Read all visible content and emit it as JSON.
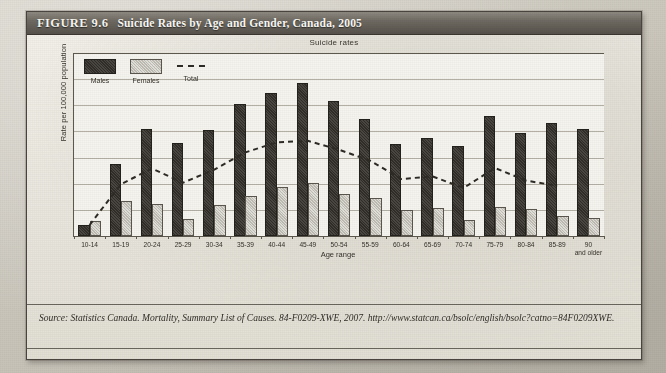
{
  "figure": {
    "label": "FIGURE 9.6",
    "title": "Suicide Rates by Age and Gender, Canada, 2005",
    "source": "Source: Statistics Canada. Mortality, Summary List of Causes. 84-F0209-XWE, 2007. http://www.statcan.ca/bsolc/english/bsolc?catno=84F0209XWE."
  },
  "legend": {
    "males": "Males",
    "females": "Females",
    "total": "Total"
  },
  "chart_data": {
    "type": "bar",
    "title": "Suicide rates",
    "xlabel": "Age range",
    "ylabel": "Rate per 100,000 population",
    "ylim": [
      0,
      35
    ],
    "yticks": [
      "0.0",
      "5.0",
      "10.0",
      "15.0",
      "20.0",
      "25.0",
      "30.0",
      "35.0"
    ],
    "grid": true,
    "legend_position": "top-left",
    "categories": [
      "10-14",
      "15-19",
      "20-24",
      "25-29",
      "30-34",
      "35-39",
      "40-44",
      "45-49",
      "50-54",
      "55-59",
      "60-64",
      "65-69",
      "70-74",
      "75-79",
      "80-84",
      "85-89",
      "90 and older"
    ],
    "series": [
      {
        "name": "Males",
        "type": "bar",
        "values": [
          1.8,
          13.4,
          20.0,
          17.4,
          19.8,
          24.8,
          27.0,
          28.8,
          25.5,
          22.0,
          17.3,
          18.3,
          16.8,
          22.6,
          19.4,
          21.3,
          20.0
        ]
      },
      {
        "name": "Females",
        "type": "bar",
        "values": [
          2.4,
          6.3,
          5.8,
          2.9,
          5.5,
          7.2,
          8.9,
          9.7,
          7.6,
          6.9,
          4.6,
          5.0,
          2.7,
          5.2,
          4.8,
          3.5,
          3.0
        ]
      },
      {
        "name": "Total",
        "type": "line",
        "style": "dashed",
        "values": [
          2.1,
          9.9,
          12.9,
          10.2,
          12.7,
          16.0,
          17.9,
          18.2,
          16.5,
          14.4,
          10.9,
          11.4,
          9.2,
          13.0,
          10.6,
          9.6,
          null
        ]
      }
    ]
  }
}
